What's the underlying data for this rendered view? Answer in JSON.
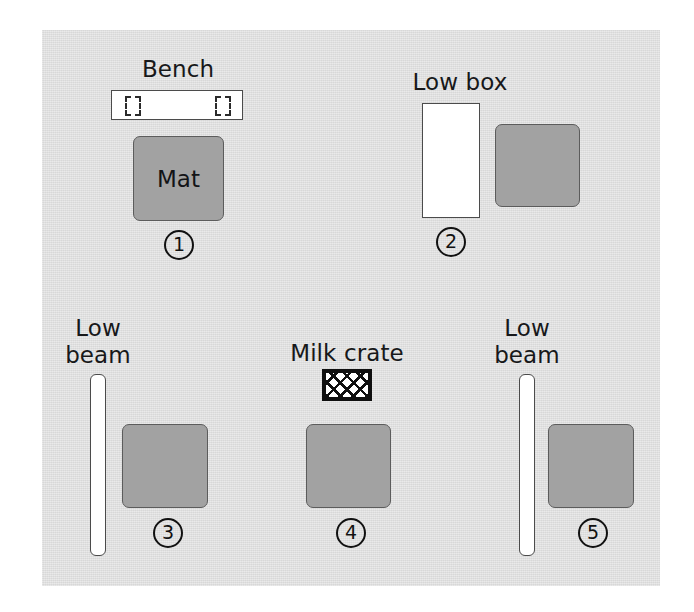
{
  "figure": {
    "panel": {
      "background_color": "#dcdcdc"
    },
    "colors": {
      "panel": "#dcdcdc",
      "mat": "#a2a2a2",
      "mat_outline": "#5c5c5c",
      "equipment_fill": "#ffffff",
      "equipment_outline": "#4b4b4b",
      "ink": "#111111"
    }
  },
  "stations": [
    {
      "number": "①",
      "number_plain": "1",
      "equipment_label": "Bench",
      "mat_label": "Mat",
      "equipment_type": "bench"
    },
    {
      "number": "②",
      "number_plain": "2",
      "equipment_label": "Low box",
      "mat_label": "",
      "equipment_type": "low-box"
    },
    {
      "number": "③",
      "number_plain": "3",
      "equipment_label": "Low\nbeam",
      "mat_label": "",
      "equipment_type": "low-beam"
    },
    {
      "number": "④",
      "number_plain": "4",
      "equipment_label": "Milk crate",
      "mat_label": "",
      "equipment_type": "milk-crate"
    },
    {
      "number": "⑤",
      "number_plain": "5",
      "equipment_label": "Low\nbeam",
      "mat_label": "",
      "equipment_type": "low-beam"
    }
  ]
}
